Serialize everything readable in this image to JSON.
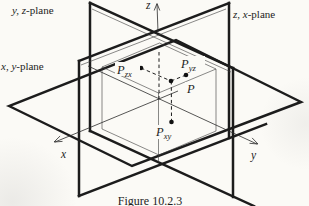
{
  "figure": {
    "caption": "Figure 10.2.3",
    "paper_color": "#fbfaf6",
    "ink_color": "#1c1c1c"
  },
  "plane_labels": {
    "yz": {
      "vars": "y, z",
      "rest": "-plane"
    },
    "zx": {
      "vars": "z, x",
      "rest": "-plane"
    },
    "xy": {
      "vars": "x, y",
      "rest": "-plane"
    }
  },
  "axis_labels": {
    "x": "x",
    "y": "y",
    "z": "z"
  },
  "point_labels": {
    "p": {
      "base": "P",
      "sub": ""
    },
    "pzx": {
      "base": "P",
      "sub": "zx"
    },
    "pyz": {
      "base": "P",
      "sub": "yz"
    },
    "pxy": {
      "base": "P",
      "sub": "xy"
    }
  }
}
